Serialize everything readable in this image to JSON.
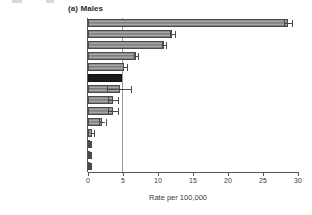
{
  "figure": {
    "title": "(a) Males",
    "artifact_note": ""
  },
  "chart_data": {
    "type": "bar",
    "orientation": "horizontal",
    "title": "(a) Males",
    "xlabel": "Rate per 100,000",
    "ylabel": "",
    "xlim": [
      0,
      30
    ],
    "xticks": [
      0,
      5,
      10,
      15,
      20,
      25,
      30
    ],
    "xtick_labels": [
      "0",
      "5",
      "10",
      "15",
      "20",
      "25",
      "30"
    ],
    "grid": false,
    "reference_line": 4.9,
    "highlight_category": "England and Wales",
    "highlight_color": "#1b1b1b",
    "bar_color": "#8d8d8d",
    "categories": [
      "Australia",
      "USA",
      "Sweden",
      "The Netherlands",
      "Italy",
      "England and Wales",
      "Zimbabwe",
      "Estonia",
      "Brazil",
      "Costa Rica",
      "Singapore",
      "India",
      "China",
      "Japan"
    ],
    "values": [
      28.5,
      12.0,
      10.8,
      6.8,
      5.2,
      4.9,
      4.5,
      3.6,
      3.6,
      2.0,
      0.6,
      0.35,
      0.3,
      0.3
    ],
    "error_low": [
      28.0,
      11.7,
      10.5,
      6.6,
      5.0,
      4.9,
      2.7,
      2.9,
      2.9,
      1.6,
      0.45,
      0.3,
      0.25,
      0.25
    ],
    "error_high": [
      29.2,
      12.4,
      11.2,
      7.1,
      5.5,
      4.9,
      6.2,
      4.3,
      4.3,
      2.5,
      0.8,
      0.45,
      0.4,
      0.4
    ],
    "legend": [],
    "annotations": []
  }
}
